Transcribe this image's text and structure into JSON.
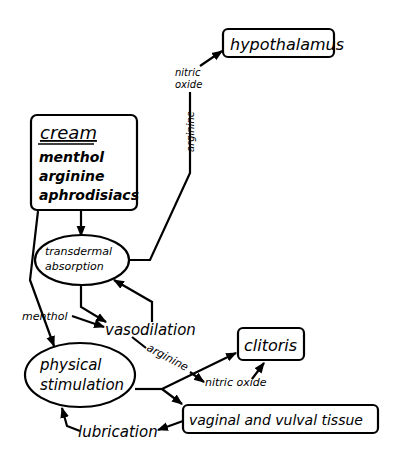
{
  "nodes": {
    "hypothalamus": "hypothalamus",
    "cream_title": "cream",
    "cream_items": [
      "menthol",
      "arginine",
      "aphrodisiacs"
    ],
    "transdermal_1": "transdermal",
    "transdermal_2": "absorption",
    "vasodilation": "vasodilation",
    "physical_1": "physical",
    "physical_2": "stimulation",
    "clitoris": "clitoris",
    "vaginal": "vaginal and vulval tissue",
    "lubrication": "lubrication"
  },
  "edge_labels": {
    "nitric_oxide_top_1": "nitric",
    "nitric_oxide_top_2": "oxide",
    "arginine_vertical": "arginine",
    "menthol": "menthol",
    "arginine_diag": "arginine",
    "nitric_oxide_bottom": "nitric oxide"
  }
}
